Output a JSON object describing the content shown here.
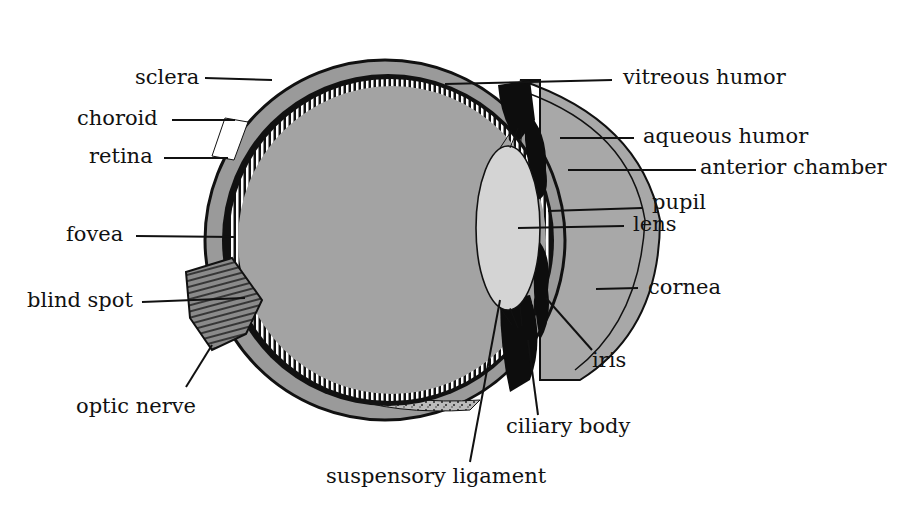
{
  "diagram": {
    "colors": {
      "vitreous": "#a3a3a3",
      "aqueous": "#a8a8a8",
      "lens": "#d4d4d4",
      "sclera": "#9a9a9a",
      "pigment": "#0d0d0d",
      "line": "#111111"
    },
    "labels": {
      "sclera": "sclera",
      "choroid": "choroid",
      "retina": "retina",
      "fovea": "fovea",
      "blind_spot": "blind spot",
      "optic_nerve": "optic nerve",
      "vitreous_humor": "vitreous humor",
      "aqueous_humor": "aqueous humor",
      "anterior_chamber": "anterior chamber",
      "pupil": "pupil",
      "lens": "lens",
      "cornea": "cornea",
      "iris": "iris",
      "ciliary_body": "ciliary body",
      "suspensory_ligament": "suspensory ligament"
    }
  }
}
